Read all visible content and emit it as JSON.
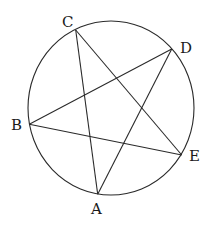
{
  "diagram": {
    "type": "inscribed-pentagram",
    "stroke_color": "#2a2a2a",
    "background": "#ffffff",
    "circle": {
      "cx": 111,
      "cy": 108,
      "rx": 83,
      "ry": 87
    },
    "points": [
      {
        "name": "A",
        "x": 97.7,
        "y": 194.3,
        "label_x": 91,
        "label_y": 214
      },
      {
        "name": "B",
        "x": 29.3,
        "y": 124.3,
        "label_x": 11,
        "label_y": 130
      },
      {
        "name": "C",
        "x": 75.7,
        "y": 30,
        "label_x": 62,
        "label_y": 27
      },
      {
        "name": "D",
        "x": 171.7,
        "y": 49,
        "label_x": 180,
        "label_y": 53
      },
      {
        "name": "E",
        "x": 181.7,
        "y": 155,
        "label_x": 189,
        "label_y": 161
      }
    ],
    "segments": [
      [
        "C",
        "A"
      ],
      [
        "C",
        "E"
      ],
      [
        "D",
        "B"
      ],
      [
        "D",
        "A"
      ],
      [
        "B",
        "E"
      ]
    ]
  }
}
